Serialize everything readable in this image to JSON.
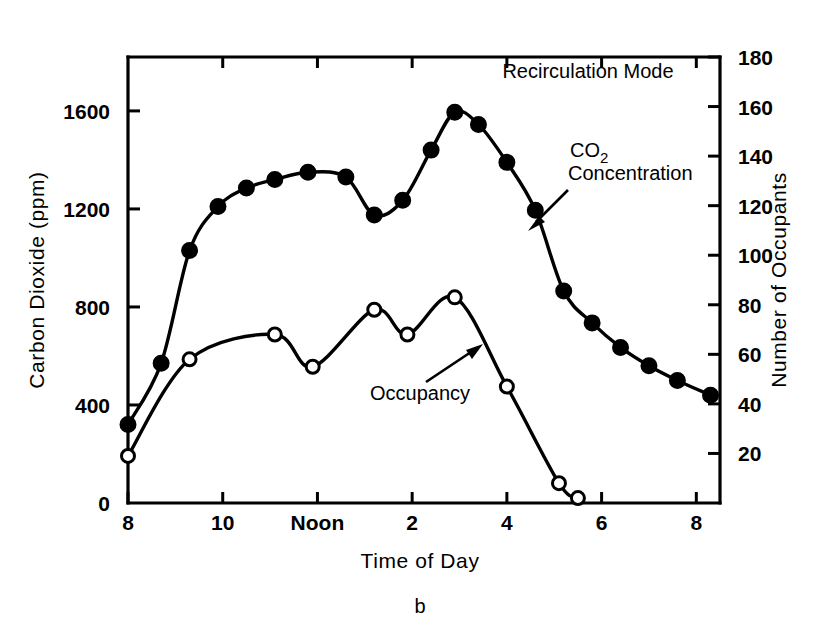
{
  "figure": {
    "panel_letter": "b",
    "annotations": {
      "mode_label": "Recirculation Mode",
      "co2_label_line1": "CO",
      "co2_label_sub": "2",
      "co2_label_line2": "Concentration",
      "occupancy_label": "Occupancy"
    }
  },
  "chart_data": {
    "type": "line",
    "title": "Recirculation Mode",
    "xlabel": "Time of Day",
    "ylabel": "Carbon Dioxide (ppm)",
    "y2label": "Number of Occupants",
    "grid": false,
    "legend": "inline-annotations",
    "xlim": [
      8,
      20.5
    ],
    "ylim": [
      0,
      1820
    ],
    "y2lim": [
      0,
      180
    ],
    "x_tick_values": [
      8,
      10,
      12,
      14,
      16,
      18,
      20
    ],
    "x_tick_labels": [
      "8",
      "10",
      "Noon",
      "2",
      "4",
      "6",
      "8"
    ],
    "y_tick_values": [
      0,
      400,
      800,
      1200,
      1600
    ],
    "y_tick_labels": [
      "0",
      "400",
      "800",
      "1200",
      "1600"
    ],
    "y2_tick_values": [
      20,
      40,
      60,
      80,
      100,
      120,
      140,
      160,
      180
    ],
    "y2_tick_labels": [
      "20",
      "40",
      "60",
      "80",
      "100",
      "120",
      "140",
      "160",
      "180"
    ],
    "series": [
      {
        "name": "CO2 Concentration",
        "axis": "left",
        "marker": "filled-circle",
        "units": "ppm",
        "points": [
          {
            "x": 8.0,
            "y": 320
          },
          {
            "x": 8.7,
            "y": 570
          },
          {
            "x": 9.3,
            "y": 1030
          },
          {
            "x": 9.9,
            "y": 1210
          },
          {
            "x": 10.5,
            "y": 1285
          },
          {
            "x": 11.1,
            "y": 1320
          },
          {
            "x": 11.8,
            "y": 1350
          },
          {
            "x": 12.6,
            "y": 1330
          },
          {
            "x": 13.2,
            "y": 1175
          },
          {
            "x": 13.8,
            "y": 1235
          },
          {
            "x": 14.4,
            "y": 1440
          },
          {
            "x": 14.9,
            "y": 1595
          },
          {
            "x": 15.4,
            "y": 1545
          },
          {
            "x": 16.0,
            "y": 1390
          },
          {
            "x": 16.6,
            "y": 1195
          },
          {
            "x": 17.2,
            "y": 865
          },
          {
            "x": 17.8,
            "y": 735
          },
          {
            "x": 18.4,
            "y": 635
          },
          {
            "x": 19.0,
            "y": 560
          },
          {
            "x": 19.6,
            "y": 500
          },
          {
            "x": 20.3,
            "y": 440
          }
        ]
      },
      {
        "name": "Occupancy",
        "axis": "right",
        "marker": "open-circle",
        "units": "occupants",
        "points": [
          {
            "x": 8.0,
            "y": 19
          },
          {
            "x": 9.3,
            "y": 58
          },
          {
            "x": 11.1,
            "y": 68
          },
          {
            "x": 11.9,
            "y": 55
          },
          {
            "x": 13.2,
            "y": 78
          },
          {
            "x": 13.9,
            "y": 68
          },
          {
            "x": 14.9,
            "y": 83
          },
          {
            "x": 16.0,
            "y": 47
          },
          {
            "x": 17.1,
            "y": 8
          },
          {
            "x": 17.5,
            "y": 2
          }
        ]
      }
    ]
  }
}
